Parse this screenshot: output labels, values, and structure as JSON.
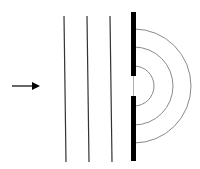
{
  "diagram": {
    "colors": {
      "background": "#ffffff",
      "wavefront": "#333333",
      "barrier": "#000000",
      "arc": "#8a8a8a",
      "arrow": "#000000"
    },
    "arrow": {
      "x1": 12,
      "y1": 86,
      "x2": 40,
      "y2": 86,
      "label": "direction-of-propagation"
    },
    "plane_wavefronts": [
      {
        "x1": 64,
        "y1": 16,
        "x2": 66,
        "y2": 162
      },
      {
        "x1": 87,
        "y1": 16,
        "x2": 89,
        "y2": 162
      },
      {
        "x1": 110,
        "y1": 16,
        "x2": 112,
        "y2": 162
      }
    ],
    "barrier": {
      "x": 131,
      "width": 5,
      "upper": {
        "y1": 12,
        "y2": 76
      },
      "lower": {
        "y1": 96,
        "y2": 161
      },
      "slit_center_y": 86
    },
    "circular_wavefronts": [
      {
        "cx": 134,
        "cy": 86,
        "r": 20
      },
      {
        "cx": 134,
        "cy": 86,
        "r": 39
      },
      {
        "cx": 134,
        "cy": 86,
        "r": 57
      }
    ]
  }
}
